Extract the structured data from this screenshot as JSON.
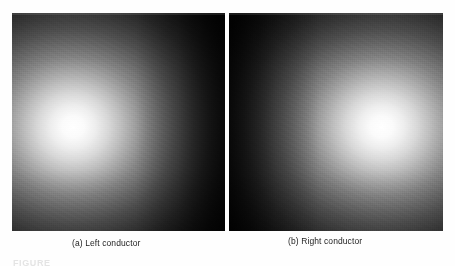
{
  "figure": {
    "kind": "grayscale-intensity-map-pair",
    "background_color": "#fefefe",
    "panels": [
      {
        "id": "a",
        "caption": "(a) Left conductor",
        "hotspot_position": "left-of-center",
        "peak_color": "#ffffff",
        "floor_color": "#060606"
      },
      {
        "id": "b",
        "caption": "(b) Right conductor",
        "hotspot_position": "right-of-center",
        "peak_color": "#ffffff",
        "floor_color": "#060606"
      }
    ],
    "figure_label": "FIGURE"
  },
  "chart_data": {
    "type": "heatmap",
    "title": "",
    "subtitle": "",
    "xlabel": "",
    "ylabel": "",
    "colormap": "grayscale",
    "colormap_low": "#000000",
    "colormap_high": "#ffffff",
    "legend_position": "none",
    "grid": false,
    "panels": [
      {
        "name": "(a) Left conductor",
        "peak_location_normalized": [
          0.31,
          0.52
        ],
        "peak_value": 1.0,
        "corner_values": {
          "top_left": 0.22,
          "top_right": 0.04,
          "bottom_left": 0.2,
          "bottom_right": 0.02
        },
        "radial_profile_normalized_radius": [
          0.0,
          0.06,
          0.12,
          0.19,
          0.26,
          0.33,
          0.4,
          0.48,
          0.56,
          0.65,
          0.74,
          0.83,
          0.92,
          1.0
        ],
        "radial_profile_intensity": [
          1.0,
          0.98,
          0.93,
          0.85,
          0.74,
          0.63,
          0.52,
          0.42,
          0.32,
          0.24,
          0.16,
          0.1,
          0.06,
          0.02
        ]
      },
      {
        "name": "(b) Right conductor",
        "peak_location_normalized": [
          0.69,
          0.52
        ],
        "peak_value": 1.0,
        "corner_values": {
          "top_left": 0.03,
          "top_right": 0.2,
          "bottom_left": 0.02,
          "bottom_right": 0.22
        },
        "radial_profile_normalized_radius": [
          0.0,
          0.06,
          0.12,
          0.19,
          0.26,
          0.33,
          0.4,
          0.48,
          0.56,
          0.65,
          0.74,
          0.83,
          0.92,
          1.0
        ],
        "radial_profile_intensity": [
          1.0,
          0.98,
          0.93,
          0.85,
          0.74,
          0.63,
          0.52,
          0.42,
          0.32,
          0.24,
          0.16,
          0.1,
          0.06,
          0.02
        ]
      }
    ]
  }
}
